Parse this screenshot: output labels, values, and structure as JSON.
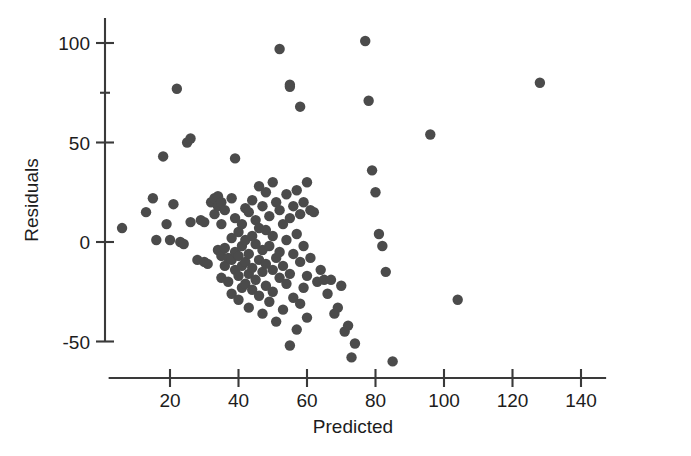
{
  "chart_data": {
    "type": "scatter",
    "title": "",
    "xlabel": "Predicted",
    "ylabel": "Residuals",
    "xlim": [
      5,
      145
    ],
    "ylim": [
      -62,
      108
    ],
    "xticks": [
      20,
      40,
      60,
      80,
      100,
      120,
      140
    ],
    "xtick_labels": [
      "20",
      "40",
      "60",
      "80",
      "100",
      "120",
      "140"
    ],
    "yticks": [
      -50,
      0,
      50,
      100
    ],
    "ytick_labels": [
      "-50",
      "0",
      "50",
      "100"
    ],
    "y_minor_ticks": [
      75
    ],
    "grid": false,
    "legend": null,
    "marker": {
      "shape": "circle",
      "color": "#4b4b4b",
      "radius_px": 5.2
    },
    "n_points": 137,
    "points": [
      [
        6,
        7
      ],
      [
        13,
        15
      ],
      [
        15,
        22
      ],
      [
        16,
        1
      ],
      [
        18,
        43
      ],
      [
        19,
        9
      ],
      [
        20,
        1
      ],
      [
        21,
        19
      ],
      [
        22,
        77
      ],
      [
        23,
        0
      ],
      [
        24,
        -1
      ],
      [
        25,
        50
      ],
      [
        26,
        52
      ],
      [
        26,
        10
      ],
      [
        28,
        -9
      ],
      [
        29,
        11
      ],
      [
        30,
        10
      ],
      [
        30,
        -10
      ],
      [
        31,
        -11
      ],
      [
        32,
        20
      ],
      [
        33,
        22
      ],
      [
        33,
        14
      ],
      [
        34,
        23
      ],
      [
        34,
        18
      ],
      [
        34,
        -4
      ],
      [
        35,
        20
      ],
      [
        35,
        9
      ],
      [
        35,
        -7
      ],
      [
        35,
        -18
      ],
      [
        36,
        16
      ],
      [
        36,
        -3
      ],
      [
        36,
        -12
      ],
      [
        37,
        -8
      ],
      [
        37,
        -20
      ],
      [
        38,
        22
      ],
      [
        38,
        2
      ],
      [
        38,
        -9
      ],
      [
        38,
        -26
      ],
      [
        39,
        42
      ],
      [
        39,
        12
      ],
      [
        39,
        -5
      ],
      [
        39,
        -14
      ],
      [
        40,
        5
      ],
      [
        40,
        -7
      ],
      [
        40,
        -17
      ],
      [
        40,
        -29
      ],
      [
        41,
        9
      ],
      [
        41,
        -2
      ],
      [
        41,
        -12
      ],
      [
        41,
        -23
      ],
      [
        42,
        17
      ],
      [
        42,
        1
      ],
      [
        42,
        -10
      ],
      [
        42,
        -21
      ],
      [
        43,
        15
      ],
      [
        43,
        -6
      ],
      [
        43,
        -16
      ],
      [
        43,
        -33
      ],
      [
        44,
        21
      ],
      [
        44,
        3
      ],
      [
        44,
        -13
      ],
      [
        44,
        -24
      ],
      [
        45,
        11
      ],
      [
        45,
        -1
      ],
      [
        45,
        -19
      ],
      [
        46,
        28
      ],
      [
        46,
        7
      ],
      [
        46,
        -9
      ],
      [
        46,
        -27
      ],
      [
        47,
        18
      ],
      [
        47,
        -4
      ],
      [
        47,
        -15
      ],
      [
        47,
        -36
      ],
      [
        48,
        25
      ],
      [
        48,
        6
      ],
      [
        48,
        -11
      ],
      [
        48,
        -22
      ],
      [
        49,
        13
      ],
      [
        49,
        -2
      ],
      [
        49,
        -30
      ],
      [
        50,
        30
      ],
      [
        50,
        3
      ],
      [
        50,
        -14
      ],
      [
        50,
        -25
      ],
      [
        51,
        20
      ],
      [
        51,
        -8
      ],
      [
        51,
        -40
      ],
      [
        52,
        97
      ],
      [
        52,
        16
      ],
      [
        52,
        -5
      ],
      [
        52,
        -18
      ],
      [
        53,
        9
      ],
      [
        53,
        -12
      ],
      [
        53,
        -34
      ],
      [
        54,
        24
      ],
      [
        54,
        1
      ],
      [
        54,
        -21
      ],
      [
        55,
        79
      ],
      [
        55,
        78
      ],
      [
        55,
        12
      ],
      [
        55,
        -16
      ],
      [
        55,
        -52
      ],
      [
        56,
        18
      ],
      [
        56,
        -6
      ],
      [
        56,
        -28
      ],
      [
        57,
        26
      ],
      [
        57,
        4
      ],
      [
        57,
        -44
      ],
      [
        58,
        68
      ],
      [
        58,
        14
      ],
      [
        58,
        -10
      ],
      [
        58,
        -31
      ],
      [
        59,
        20
      ],
      [
        59,
        -2
      ],
      [
        59,
        -23
      ],
      [
        60,
        30
      ],
      [
        60,
        -17
      ],
      [
        60,
        -38
      ],
      [
        61,
        16
      ],
      [
        61,
        -8
      ],
      [
        62,
        15
      ],
      [
        63,
        -20
      ],
      [
        64,
        -14
      ],
      [
        65,
        -19
      ],
      [
        66,
        -26
      ],
      [
        67,
        -19
      ],
      [
        68,
        -36
      ],
      [
        69,
        -33
      ],
      [
        70,
        -22
      ],
      [
        71,
        -45
      ],
      [
        72,
        -42
      ],
      [
        73,
        -58
      ],
      [
        74,
        -51
      ],
      [
        77,
        101
      ],
      [
        78,
        71
      ],
      [
        79,
        36
      ],
      [
        80,
        25
      ],
      [
        81,
        4
      ],
      [
        82,
        -2
      ],
      [
        83,
        -15
      ],
      [
        85,
        -60
      ],
      [
        96,
        54
      ],
      [
        104,
        -29
      ],
      [
        128,
        80
      ]
    ]
  },
  "axes": {
    "x_axis_name": "x-axis",
    "y_axis_name": "y-axis"
  }
}
